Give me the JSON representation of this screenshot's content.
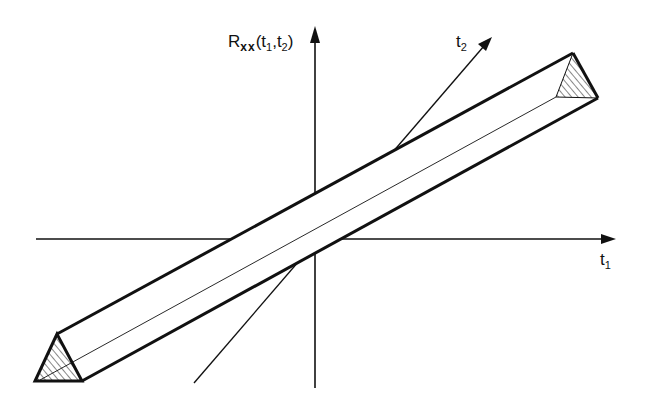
{
  "figure": {
    "type": "3d-correlation-ridge-diagram"
  },
  "labels": {
    "vertical_axis": {
      "base": "R",
      "subscript": "xx",
      "args": "(t",
      "arg1_sub": "1",
      "sep": ",t",
      "arg2_sub": "2",
      "close": ")"
    },
    "t1_axis": {
      "base": "t",
      "sub": "1"
    },
    "t2_axis": {
      "base": "t",
      "sub": "2"
    }
  },
  "colors": {
    "ink": "#111111",
    "background": "#ffffff"
  },
  "geometry": {
    "origin": [
      315,
      239
    ],
    "t1_axis": {
      "from": [
        36,
        239
      ],
      "to": [
        616,
        239
      ]
    },
    "vertical_axis": {
      "from": [
        315,
        388
      ],
      "to": [
        315,
        27
      ]
    },
    "t2_axis": {
      "from": [
        194,
        383
      ],
      "to": [
        492,
        37
      ]
    },
    "ridge": {
      "near_end_triangle": [
        [
          57,
          334
        ],
        [
          35,
          381
        ],
        [
          82,
          381
        ]
      ],
      "far_end_triangle": [
        [
          573,
          53
        ],
        [
          556,
          97
        ],
        [
          598,
          98
        ]
      ]
    }
  }
}
